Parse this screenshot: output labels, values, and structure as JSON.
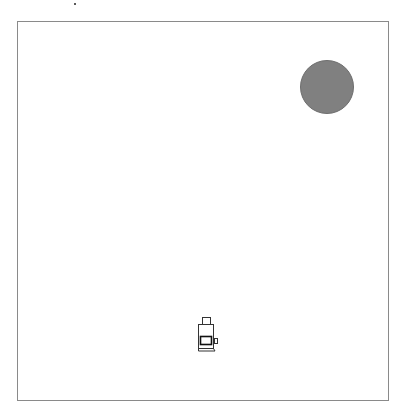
{
  "scene": {
    "arena": {
      "x": 17,
      "y": 21,
      "width": 372,
      "height": 380,
      "border_color": "#8a8a8a"
    },
    "target": {
      "shape": "circle",
      "cx": 327,
      "cy": 87,
      "radius": 27,
      "color": "#808080"
    },
    "agent": {
      "icon": "robot-agent-icon",
      "x": 198,
      "y": 318,
      "width": 20,
      "height": 34
    }
  }
}
